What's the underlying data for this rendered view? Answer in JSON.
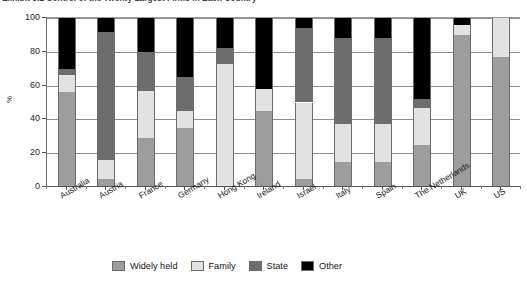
{
  "chart_data": {
    "type": "bar",
    "subtype": "stacked-column-100",
    "title": "Exhibit 3.2  Control of the Twenty Largest Firms in Each Country",
    "xlabel": "",
    "ylabel": "%",
    "ylim": [
      0,
      100
    ],
    "yticks": [
      0,
      20,
      40,
      60,
      80,
      100
    ],
    "grid": true,
    "legend_position": "bottom",
    "categories": [
      "Australia",
      "Austria",
      "France",
      "Germany",
      "Hong Kong",
      "Ireland",
      "Israel",
      "Italy",
      "Spain",
      "The Netherlands",
      "UK",
      "US"
    ],
    "series": [
      {
        "name": "Widely held",
        "color": "#9d9d9d",
        "values": [
          56,
          5,
          29,
          35,
          0,
          45,
          5,
          15,
          15,
          25,
          90,
          77
        ]
      },
      {
        "name": "Family",
        "color": "#e2e2e2",
        "values": [
          10,
          11,
          28,
          10,
          73,
          13,
          45,
          22,
          22,
          22,
          6,
          23
        ]
      },
      {
        "name": "State",
        "color": "#6d6d6d",
        "values": [
          4,
          76,
          23,
          20,
          9,
          0,
          44,
          51,
          51,
          5,
          0,
          0
        ]
      },
      {
        "name": "Other",
        "color": "#000000",
        "values": [
          30,
          8,
          20,
          35,
          18,
          42,
          6,
          12,
          12,
          48,
          4,
          0
        ]
      }
    ]
  },
  "legend": {
    "items": [
      {
        "label": "Widely held",
        "color": "#9d9d9d"
      },
      {
        "label": "Family",
        "color": "#e2e2e2"
      },
      {
        "label": "State",
        "color": "#6d6d6d"
      },
      {
        "label": "Other",
        "color": "#000000"
      }
    ]
  }
}
